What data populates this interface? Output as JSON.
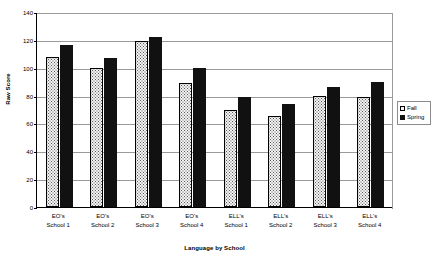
{
  "chart_data": {
    "type": "bar",
    "title": "",
    "xlabel": "Language by School",
    "ylabel": "Raw Score",
    "ylim": [
      0,
      140
    ],
    "ytick_step": 20,
    "yticks": [
      0,
      20,
      40,
      60,
      80,
      100,
      120,
      140
    ],
    "grid": true,
    "legend_position": "right",
    "categories": [
      "EO's School 1",
      "EO's School 2",
      "EO's School 3",
      "EO's School 4",
      "ELL's School 1",
      "ELL's School 2",
      "ELL's School 3",
      "ELL's School 4"
    ],
    "category_lines": [
      [
        "EO's",
        "School 1"
      ],
      [
        "EO's",
        "School 2"
      ],
      [
        "EO's",
        "School 3"
      ],
      [
        "EO's",
        "School 4"
      ],
      [
        "ELL's",
        "School 1"
      ],
      [
        "ELL's",
        "School 2"
      ],
      [
        "ELL's",
        "School 3"
      ],
      [
        "ELL's",
        "School 4"
      ]
    ],
    "series": [
      {
        "name": "Fall",
        "color": "#F2F2F2",
        "pattern": "dotted",
        "values": [
          108,
          100,
          119,
          89,
          70,
          65,
          80,
          79
        ]
      },
      {
        "name": "Spring",
        "color": "#111111",
        "pattern": "solid",
        "values": [
          116,
          107,
          122,
          100,
          79,
          74,
          86,
          90
        ]
      }
    ]
  },
  "legend": {
    "items": [
      {
        "label": "Fall",
        "swatch": "fall"
      },
      {
        "label": "Spring",
        "swatch": "spring"
      }
    ]
  },
  "axes": {
    "y_title": "Raw Score",
    "x_title": "Language by School"
  }
}
